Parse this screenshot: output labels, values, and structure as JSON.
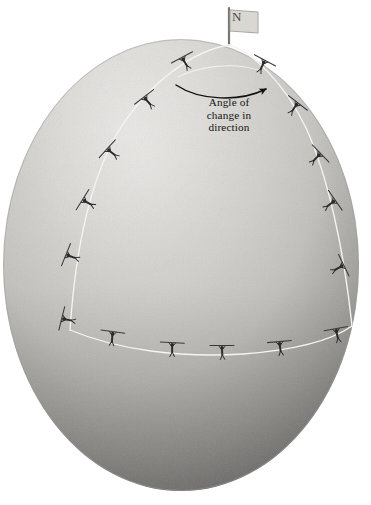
{
  "figure": {
    "kind": "illustration",
    "background_color": "#ffffff"
  },
  "sphere": {
    "label": "globe",
    "center_x": 181,
    "center_y": 265,
    "radius_x": 178,
    "radius_y": 226,
    "fill_light": "#d8d6d2",
    "fill_mid": "#c3c1bd",
    "fill_shadow": "#8d8b88",
    "edge_color": "#b5b3af"
  },
  "flag": {
    "name": "north-pole-flag",
    "letter": "N",
    "pole_color": "#787672",
    "cloth_color": "#e9e7e3",
    "cloth_border": "#9a9894",
    "letter_color": "#4a4a4a",
    "pole_x": 229,
    "pole_top_y": 8,
    "pole_bottom_y": 45
  },
  "annotation": {
    "name": "angle-of-change-annotation",
    "line1": "Angle of",
    "line2": "change in",
    "line3": "direction",
    "text_color": "#141414",
    "arc": {
      "name": "angle-arc-arrow",
      "color": "#111111",
      "start_x": 175,
      "start_y": 85,
      "end_x": 268,
      "end_y": 95,
      "arrowhead": "right"
    }
  },
  "path": {
    "name": "spherical-triangle-path",
    "color": "#f4f2ee",
    "stroke_width": 1.3,
    "description": "closed path from north pole down the left meridian, along the equator-like arc, and back up the right meridian to the pole"
  },
  "walkers": {
    "name": "walking-figures-with-pole",
    "body_color": "#2b2b2b",
    "pole_color": "#3a3a3a",
    "count": 18,
    "items": [
      {
        "id": "w-left-1",
        "x": 185,
        "y": 63,
        "rot": -28,
        "seg": "left-meridian"
      },
      {
        "id": "w-left-2",
        "x": 148,
        "y": 102,
        "rot": -38,
        "seg": "left-meridian"
      },
      {
        "id": "w-left-3",
        "x": 112,
        "y": 153,
        "rot": -48,
        "seg": "left-meridian"
      },
      {
        "id": "w-left-4",
        "x": 88,
        "y": 203,
        "rot": -58,
        "seg": "left-meridian"
      },
      {
        "id": "w-left-5",
        "x": 72,
        "y": 257,
        "rot": -68,
        "seg": "left-meridian"
      },
      {
        "id": "w-left-6",
        "x": 68,
        "y": 320,
        "rot": -76,
        "seg": "left-meridian"
      },
      {
        "id": "w-bot-1",
        "x": 112,
        "y": 338,
        "rot": 8,
        "seg": "equator"
      },
      {
        "id": "w-bot-2",
        "x": 172,
        "y": 349,
        "rot": 3,
        "seg": "equator"
      },
      {
        "id": "w-bot-3",
        "x": 222,
        "y": 352,
        "rot": 0,
        "seg": "equator"
      },
      {
        "id": "w-bot-4",
        "x": 280,
        "y": 348,
        "rot": -5,
        "seg": "equator"
      },
      {
        "id": "w-bot-5",
        "x": 337,
        "y": 335,
        "rot": -10,
        "seg": "equator"
      },
      {
        "id": "w-right-1",
        "x": 262,
        "y": 66,
        "rot": 28,
        "seg": "right-meridian"
      },
      {
        "id": "w-right-2",
        "x": 294,
        "y": 108,
        "rot": 38,
        "seg": "right-meridian"
      },
      {
        "id": "w-right-3",
        "x": 316,
        "y": 158,
        "rot": 46,
        "seg": "right-meridian"
      },
      {
        "id": "w-right-4",
        "x": 330,
        "y": 204,
        "rot": 55,
        "seg": "right-meridian"
      },
      {
        "id": "w-right-5",
        "x": 338,
        "y": 268,
        "rot": 64,
        "seg": "right-meridian"
      }
    ]
  }
}
